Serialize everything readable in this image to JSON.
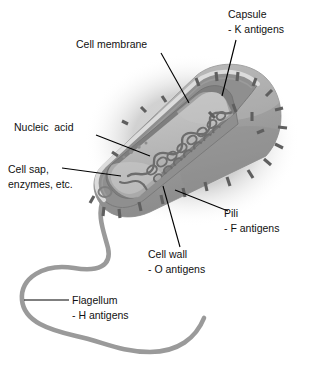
{
  "figure": {
    "name": "bacterial-cell-structure-diagram",
    "background_color": "#ffffff",
    "text_color": "#111111"
  },
  "labels": [
    {
      "id": "capsule",
      "line1": "Capsule",
      "line2": "- K antigens",
      "text_x": 228,
      "text_y": 18,
      "align": "start",
      "leader": "M236,40 L222,96"
    },
    {
      "id": "cell-membrane",
      "line1": "Cell membrane",
      "line2": "",
      "text_x": 76,
      "text_y": 48,
      "align": "start",
      "leader": "M161,53 L189,103"
    },
    {
      "id": "nucleic-acid",
      "line1": "Nucleic  acid",
      "line2": "",
      "text_x": 14,
      "text_y": 131,
      "align": "start",
      "leader": "M96,135 L150,156"
    },
    {
      "id": "cell-sap-enzymes",
      "line1": "Cell sap,",
      "line2": "enzymes, etc.",
      "text_x": 8,
      "text_y": 173,
      "align": "start",
      "leader": "M62,168 L121,176"
    },
    {
      "id": "pili",
      "line1": "Pili",
      "line2": "- F antigens",
      "text_x": 224,
      "text_y": 217,
      "align": "start",
      "leader": "M175,190 L228,211"
    },
    {
      "id": "cell-wall",
      "line1": "Cell wall",
      "line2": "- O antigens",
      "text_x": 148,
      "text_y": 258,
      "align": "start",
      "leader": "M163,186 L180,247"
    },
    {
      "id": "flagellum",
      "line1": "Flagellum",
      "line2": "- H antigens",
      "text_x": 72,
      "text_y": 304,
      "align": "start",
      "leader": "M24,300 L69,300"
    }
  ],
  "colors": {
    "capsule_body": "#9d9d9d",
    "capsule_light": "#b4b4b4",
    "capsule_shadow": "#8a8a8a",
    "cell_wall_band": "#8f8f8f",
    "cell_wall_dark": "#7b7b7b",
    "cytoplasm": "#b9b9b9",
    "cytoplasm_light": "#c6c6c6",
    "highlight_rim": "#d8d8d8",
    "nucleic_acid": "#6d6d6d",
    "pili": "#5f5f5f",
    "flagellum": "#9a9a9a",
    "halo": "#dcdcdc"
  },
  "pili": [
    {
      "x1": 196,
      "y1": 78,
      "x2": 199,
      "y2": 86
    },
    {
      "x1": 216,
      "y1": 72,
      "x2": 217,
      "y2": 81
    },
    {
      "x1": 238,
      "y1": 72,
      "x2": 237,
      "y2": 81
    },
    {
      "x1": 256,
      "y1": 78,
      "x2": 253,
      "y2": 86
    },
    {
      "x1": 272,
      "y1": 90,
      "x2": 266,
      "y2": 96
    },
    {
      "x1": 283,
      "y1": 108,
      "x2": 275,
      "y2": 110
    },
    {
      "x1": 287,
      "y1": 128,
      "x2": 278,
      "y2": 127
    },
    {
      "x1": 283,
      "y1": 148,
      "x2": 275,
      "y2": 144
    },
    {
      "x1": 271,
      "y1": 165,
      "x2": 264,
      "y2": 159
    },
    {
      "x1": 253,
      "y1": 178,
      "x2": 248,
      "y2": 170
    },
    {
      "x1": 230,
      "y1": 186,
      "x2": 227,
      "y2": 177
    },
    {
      "x1": 207,
      "y1": 191,
      "x2": 205,
      "y2": 182
    },
    {
      "x1": 185,
      "y1": 197,
      "x2": 183,
      "y2": 188
    },
    {
      "x1": 163,
      "y1": 204,
      "x2": 161,
      "y2": 195
    },
    {
      "x1": 141,
      "y1": 211,
      "x2": 139,
      "y2": 202
    },
    {
      "x1": 120,
      "y1": 218,
      "x2": 119,
      "y2": 209
    },
    {
      "x1": 103,
      "y1": 216,
      "x2": 104,
      "y2": 207
    },
    {
      "x1": 90,
      "y1": 203,
      "x2": 94,
      "y2": 196
    },
    {
      "x1": 209,
      "y1": 112,
      "x2": 215,
      "y2": 118
    },
    {
      "x1": 233,
      "y1": 104,
      "x2": 236,
      "y2": 112
    },
    {
      "x1": 252,
      "y1": 112,
      "x2": 252,
      "y2": 121
    },
    {
      "x1": 264,
      "y1": 130,
      "x2": 257,
      "y2": 133
    },
    {
      "x1": 118,
      "y1": 156,
      "x2": 112,
      "y2": 152
    },
    {
      "x1": 128,
      "y1": 124,
      "x2": 122,
      "y2": 121
    },
    {
      "x1": 146,
      "y1": 112,
      "x2": 141,
      "y2": 107
    },
    {
      "x1": 166,
      "y1": 102,
      "x2": 162,
      "y2": 96
    }
  ],
  "granules": [
    {
      "cx": 131,
      "cy": 152,
      "r": 2.0
    },
    {
      "cx": 139,
      "cy": 147,
      "r": 1.7
    },
    {
      "cx": 146,
      "cy": 143,
      "r": 1.5
    },
    {
      "cx": 124,
      "cy": 157,
      "r": 1.6
    }
  ]
}
